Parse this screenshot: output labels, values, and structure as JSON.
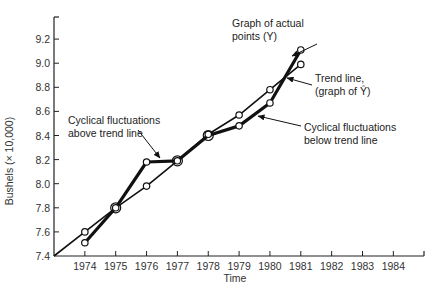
{
  "chart_data": {
    "type": "line",
    "title": "",
    "xlabel": "Time",
    "ylabel": "Bushels (× 10,000)",
    "ylim": [
      7.4,
      9.4
    ],
    "xlim": [
      1973,
      1985
    ],
    "grid": false,
    "legend": "none (annotations with arrows)",
    "y_ticks": [
      "7.4",
      "7.6",
      "7.8",
      "8.0",
      "8.2",
      "8.4",
      "8.6",
      "8.8",
      "9.0",
      "9.2"
    ],
    "x_ticks": [
      "1974",
      "1975",
      "1976",
      "1977",
      "1978",
      "1979",
      "1980",
      "1981",
      "1982",
      "1983",
      "1984"
    ],
    "categories": [
      1974,
      1975,
      1976,
      1977,
      1978,
      1979,
      1980,
      1981
    ],
    "series": [
      {
        "name": "Graph of actual points (Y)",
        "style": "thick line with circle markers",
        "values": [
          7.51,
          7.8,
          8.18,
          8.19,
          8.4,
          8.48,
          8.67,
          9.11
        ]
      },
      {
        "name": "Trend line (graph of Ŷ)",
        "style": "thin line with circle markers, extends back to origin (1973, 7.4)",
        "values": [
          7.6,
          7.8,
          7.98,
          8.19,
          8.41,
          8.57,
          8.78,
          8.99
        ]
      }
    ],
    "annotations": [
      {
        "text_lines": [
          "Graph of actual",
          "points (Y)"
        ],
        "points_to": "actual line near 1981"
      },
      {
        "text_lines": [
          "Trend line,",
          "(graph of Ŷ)"
        ],
        "points_to": "trend line near 1980.5"
      },
      {
        "text_lines": [
          "Cyclical fluctuations",
          "above trend line"
        ],
        "points_to": "actual line between 1976 and 1977"
      },
      {
        "text_lines": [
          "Cyclical fluctuations",
          "below trend line"
        ],
        "points_to": "actual line between 1978 and 1979"
      }
    ]
  },
  "labels": {
    "xlabel": "Time",
    "ylabel": "Bushels (× 10,000)",
    "anno_actual_1": "Graph of actual",
    "anno_actual_2": "points (Y)",
    "anno_trend_1": "Trend line,",
    "anno_trend_2": "(graph of Ŷ)",
    "anno_above_1": "Cyclical fluctuations",
    "anno_above_2": "above trend line",
    "anno_below_1": "Cyclical fluctuations",
    "anno_below_2": "below trend line"
  }
}
